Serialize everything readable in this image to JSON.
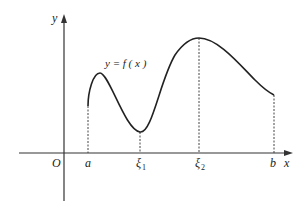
{
  "figure": {
    "axes": {
      "x_label": "x",
      "y_label": "y",
      "origin_label": "O"
    },
    "function_label": "y = f ( x )",
    "points": [
      {
        "name": "a",
        "label": "a",
        "subscript": ""
      },
      {
        "name": "xi1",
        "label": "ξ",
        "subscript": "1"
      },
      {
        "name": "xi2",
        "label": "ξ",
        "subscript": "2"
      },
      {
        "name": "b",
        "label": "b",
        "subscript": ""
      }
    ]
  }
}
